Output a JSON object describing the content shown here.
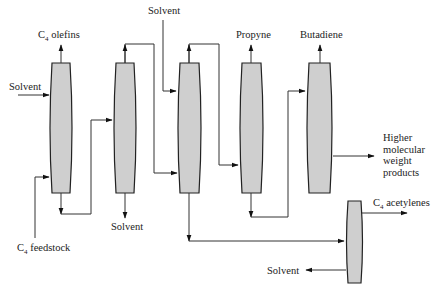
{
  "diagram": {
    "labels": {
      "c4_olefins": {
        "main": "C",
        "sub": "4",
        "rest": " olefins"
      },
      "solvent_in_1": "Solvent",
      "c4_feedstock": {
        "main": "C",
        "sub": "4",
        "rest": " feedstock"
      },
      "solvent_out_2": "Solvent",
      "solvent_in_3": "Solvent",
      "propyne": "Propyne",
      "butadiene": "Butadiene",
      "higher_products": [
        "Higher",
        "molecular",
        "weight",
        "products"
      ],
      "c4_acetylenes": {
        "main": "C",
        "sub": "4",
        "rest": " acetylenes"
      },
      "solvent_out_6": "Solvent"
    },
    "columns": [
      {
        "id": "column-1",
        "name": "Extractive distillation column 1"
      },
      {
        "id": "column-2",
        "name": "Solvent stripper 1"
      },
      {
        "id": "column-3",
        "name": "Extractive distillation column 2"
      },
      {
        "id": "column-4",
        "name": "Propyne column"
      },
      {
        "id": "column-5",
        "name": "Butadiene column"
      },
      {
        "id": "column-6",
        "name": "Acetylene stripper"
      }
    ],
    "colors": {
      "column_fill": "#cfcfcf",
      "line": "#333333"
    }
  }
}
